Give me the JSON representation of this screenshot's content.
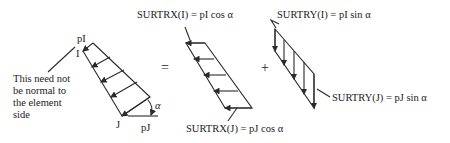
{
  "left_panel": {
    "label_pI": "pI",
    "node_I": "I",
    "node_J": "J",
    "label_pJ": "pJ",
    "angle": "α",
    "note_lines": [
      "This need not",
      "be normal to",
      "the element",
      "side"
    ]
  },
  "operators": {
    "equals": "=",
    "plus": "+"
  },
  "middle_panel": {
    "top_label": "SURTRX(I) = pI cos α",
    "bottom_label": "SURTRX(J) = pJ cos α"
  },
  "right_panel": {
    "top_label": "SURTRY(I) = pI sin α",
    "side_label": "SURTRY(J) = pJ sin α"
  },
  "colors": {
    "stroke": "#2a2a2a",
    "background": "#ffffff"
  }
}
